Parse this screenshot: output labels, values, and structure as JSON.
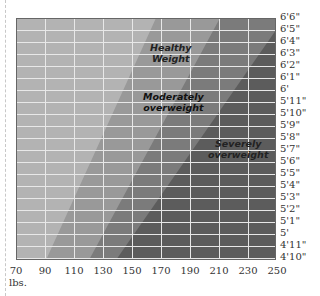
{
  "chart_data": {
    "type": "area",
    "title": "",
    "xlabel": "lbs.",
    "ylabel": "",
    "x_ticks": [
      "70",
      "90",
      "110",
      "130",
      "150",
      "170",
      "190",
      "210",
      "230",
      "250"
    ],
    "y_ticks": [
      "6'6\"",
      "6'5\"",
      "6'4\"",
      "6'3\"",
      "6'2\"",
      "6'1\"",
      "6'",
      "5'11\"",
      "5'10\"",
      "5'9\"",
      "5'8\"",
      "5'7\"",
      "5'6\"",
      "5'5\"",
      "5'4\"",
      "5'3\"",
      "5'2\"",
      "5'1\"",
      "5'",
      "4'11\"",
      "4'10\""
    ],
    "xlim": [
      70,
      250
    ],
    "ylim": [
      "4'10\"",
      "6'6\""
    ],
    "grid": true,
    "regions": [
      {
        "name": "Underweight",
        "label": "",
        "color": "#b3b3b3"
      },
      {
        "name": "Healthy Weight",
        "label": "Healthy Weight",
        "color": "#989898",
        "lower_boundary": {
          "at_4_10": 91,
          "at_6_6": 164
        }
      },
      {
        "name": "Moderately overweight",
        "label": "Moderately overweight",
        "color": "#7a7a7a",
        "lower_boundary": {
          "at_4_10": 119,
          "at_6_6": 210
        }
      },
      {
        "name": "Severely overweight",
        "label": "Severely overweight",
        "color": "#5a5a5a",
        "lower_boundary": {
          "at_4_10": 137,
          "at_6_6": 250
        }
      }
    ]
  },
  "labels": {
    "healthy_1": "Healthy",
    "healthy_2": "Weight",
    "moderate_1": "Moderately",
    "moderate_2": "overweight",
    "severe_1": "Severely",
    "severe_2": "overweight",
    "unit": "lbs."
  },
  "y_labels": [
    "6'6\"",
    "6'5\"",
    "6'4\"",
    "6'3\"",
    "6'2\"",
    "6'1\"",
    "6'",
    "5'11\"",
    "5'10\"",
    "5'9\"",
    "5'8\"",
    "5'7\"",
    "5'6\"",
    "5'5\"",
    "5'4\"",
    "5'3\"",
    "5'2\"",
    "5'1\"",
    "5'",
    "4'11\"",
    "4'10\""
  ],
  "x_labels": [
    "70",
    "90",
    "110",
    "130",
    "150",
    "170",
    "190",
    "210",
    "230",
    "250"
  ]
}
